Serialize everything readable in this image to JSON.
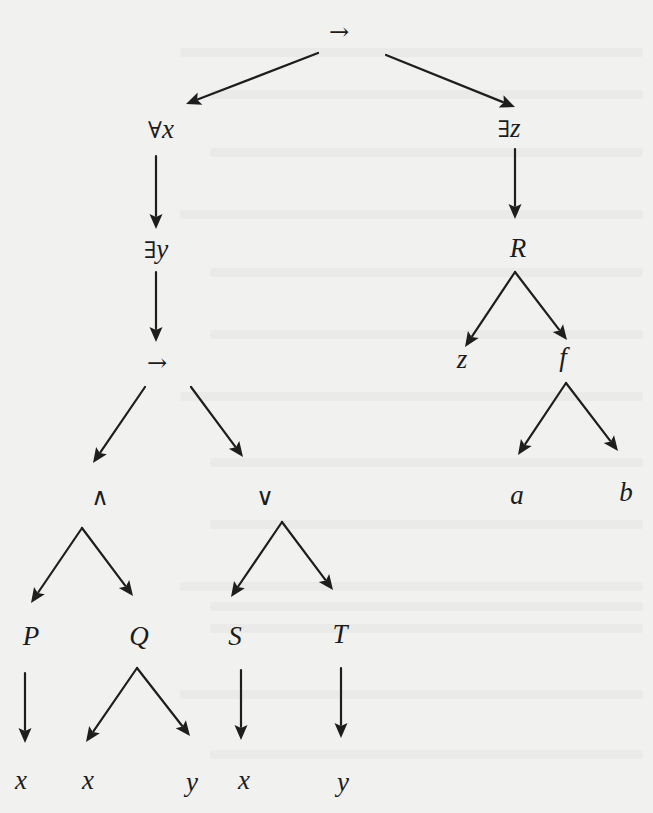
{
  "diagram": {
    "type": "syntax-tree",
    "background_color": "#f1f1f0",
    "ink_color": "#1e1e1e",
    "nodes": [
      {
        "id": "root",
        "label": "→",
        "x": 339,
        "y": 33,
        "style": "symbol"
      },
      {
        "id": "forall",
        "label": "∀x",
        "x": 161,
        "y": 132,
        "style": "mixed",
        "op": "∀",
        "var": "x"
      },
      {
        "id": "exists_z",
        "label": "∃z",
        "x": 509,
        "y": 131,
        "style": "mixed",
        "op": "∃",
        "var": "z"
      },
      {
        "id": "exists_y",
        "label": "∃y",
        "x": 156,
        "y": 252,
        "style": "mixed",
        "op": "∃",
        "var": "y"
      },
      {
        "id": "R",
        "label": "R",
        "x": 518,
        "y": 251,
        "style": "italic"
      },
      {
        "id": "imp2",
        "label": "→",
        "x": 157,
        "y": 364,
        "style": "symbol"
      },
      {
        "id": "z_leaf",
        "label": "z",
        "x": 462,
        "y": 362,
        "style": "italic"
      },
      {
        "id": "f",
        "label": "f",
        "x": 563,
        "y": 360,
        "style": "italic"
      },
      {
        "id": "and",
        "label": "∧",
        "x": 100,
        "y": 498,
        "style": "symbol"
      },
      {
        "id": "or",
        "label": "∨",
        "x": 265,
        "y": 498,
        "style": "symbol"
      },
      {
        "id": "a",
        "label": "a",
        "x": 517,
        "y": 498,
        "style": "italic"
      },
      {
        "id": "b",
        "label": "b",
        "x": 626,
        "y": 495,
        "style": "italic"
      },
      {
        "id": "P",
        "label": "P",
        "x": 31,
        "y": 639,
        "style": "italic"
      },
      {
        "id": "Q",
        "label": "Q",
        "x": 139,
        "y": 639,
        "style": "italic"
      },
      {
        "id": "S",
        "label": "S",
        "x": 235,
        "y": 639,
        "style": "italic"
      },
      {
        "id": "T",
        "label": "T",
        "x": 340,
        "y": 637,
        "style": "italic"
      },
      {
        "id": "x1",
        "label": "x",
        "x": 21,
        "y": 783,
        "style": "italic"
      },
      {
        "id": "x2",
        "label": "x",
        "x": 88,
        "y": 783,
        "style": "italic"
      },
      {
        "id": "y1",
        "label": "y",
        "x": 192,
        "y": 785,
        "style": "italic"
      },
      {
        "id": "x3",
        "label": "x",
        "x": 244,
        "y": 783,
        "style": "italic"
      },
      {
        "id": "y2",
        "label": "y",
        "x": 343,
        "y": 785,
        "style": "italic"
      }
    ],
    "edges": [
      {
        "from": "root",
        "to": "forall",
        "x1": 318,
        "y1": 53,
        "x2": 186,
        "y2": 104
      },
      {
        "from": "root",
        "to": "exists_z",
        "x1": 386,
        "y1": 55,
        "x2": 515,
        "y2": 107
      },
      {
        "from": "forall",
        "to": "exists_y",
        "x1": 156,
        "y1": 156,
        "x2": 156,
        "y2": 229
      },
      {
        "from": "exists_z",
        "to": "R",
        "x1": 515,
        "y1": 149,
        "x2": 515,
        "y2": 219
      },
      {
        "from": "exists_y",
        "to": "imp2",
        "x1": 156,
        "y1": 272,
        "x2": 156,
        "y2": 342
      },
      {
        "from": "R",
        "to": "z_leaf",
        "x1": 515,
        "y1": 272,
        "x2": 465,
        "y2": 347
      },
      {
        "from": "R",
        "to": "f",
        "x1": 515,
        "y1": 272,
        "x2": 567,
        "y2": 340
      },
      {
        "from": "imp2",
        "to": "and",
        "x1": 145,
        "y1": 387,
        "x2": 93,
        "y2": 463
      },
      {
        "from": "imp2",
        "to": "or",
        "x1": 191,
        "y1": 387,
        "x2": 243,
        "y2": 457
      },
      {
        "from": "f",
        "to": "a",
        "x1": 566,
        "y1": 383,
        "x2": 518,
        "y2": 455
      },
      {
        "from": "f",
        "to": "b",
        "x1": 566,
        "y1": 383,
        "x2": 618,
        "y2": 451
      },
      {
        "from": "and",
        "to": "P",
        "x1": 82,
        "y1": 528,
        "x2": 31,
        "y2": 603
      },
      {
        "from": "and",
        "to": "Q",
        "x1": 82,
        "y1": 528,
        "x2": 133,
        "y2": 596
      },
      {
        "from": "or",
        "to": "S",
        "x1": 282,
        "y1": 522,
        "x2": 231,
        "y2": 597
      },
      {
        "from": "or",
        "to": "T",
        "x1": 282,
        "y1": 522,
        "x2": 333,
        "y2": 590
      },
      {
        "from": "P",
        "to": "x1",
        "x1": 25,
        "y1": 673,
        "x2": 25,
        "y2": 743
      },
      {
        "from": "Q",
        "to": "x2",
        "x1": 137,
        "y1": 668,
        "x2": 86,
        "y2": 742
      },
      {
        "from": "Q",
        "to": "y1",
        "x1": 137,
        "y1": 668,
        "x2": 190,
        "y2": 736
      },
      {
        "from": "S",
        "to": "x3",
        "x1": 241,
        "y1": 670,
        "x2": 241,
        "y2": 740
      },
      {
        "from": "T",
        "to": "y2",
        "x1": 341,
        "y1": 668,
        "x2": 341,
        "y2": 738
      }
    ],
    "bleed_through_lines_y": [
      48,
      90,
      148,
      210,
      268,
      330,
      392,
      458,
      520,
      582,
      602,
      624,
      690,
      750
    ]
  }
}
